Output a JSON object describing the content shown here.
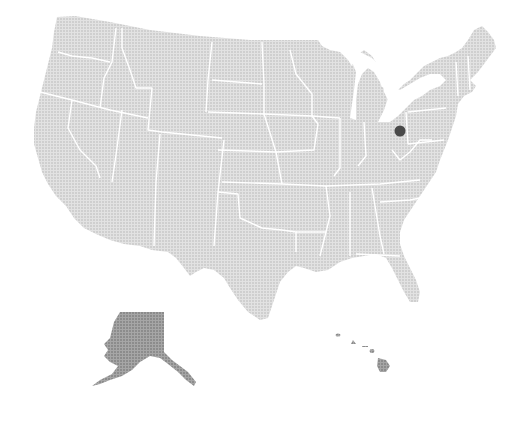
{
  "map": {
    "title": "United States",
    "colors": {
      "background": "#ffffff",
      "land_fill": "#dcdcdc",
      "dot_pattern": "#c8c8c8",
      "state_border": "#ffffff",
      "alaska_fill": "#9a9a9a",
      "hawaii_fill": "#9a9a9a",
      "marker": "#4a4a4a"
    },
    "regions": [
      "Contiguous United States",
      "Alaska",
      "Hawaii"
    ],
    "markers": [
      {
        "label": "Northeast Ohio",
        "x": 400,
        "y": 131,
        "radius": 5.5
      }
    ]
  }
}
